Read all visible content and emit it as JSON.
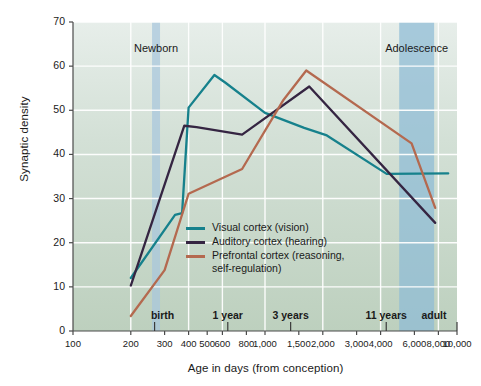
{
  "chart_data": {
    "type": "line",
    "title": "",
    "xlabel": "Age in days (from conception)",
    "ylabel": "Synaptic density",
    "xscale": "log",
    "xlim": [
      100,
      10000
    ],
    "ylim": [
      0,
      70
    ],
    "grid": true,
    "legend_position": "center",
    "y_ticks": [
      0,
      10,
      20,
      30,
      40,
      50,
      60,
      70
    ],
    "x_ticks": [
      100,
      200,
      300,
      400,
      500,
      600,
      800,
      1000,
      1500,
      2000,
      3000,
      4000,
      6000,
      8000,
      10000
    ],
    "x_tick_labels": [
      "100",
      "200",
      "300",
      "400",
      "500",
      "600",
      "800",
      "1,000",
      "1,500",
      "2,000",
      "3,000",
      "4,000",
      "6,000",
      "8,000",
      "10,000"
    ],
    "milestones": [
      {
        "label": "birth",
        "x": 266
      },
      {
        "label": "1 year",
        "x": 640
      },
      {
        "label": "3 years",
        "x": 1360
      },
      {
        "label": "11 years",
        "x": 4280
      },
      {
        "label": "adult",
        "x": 10000
      }
    ],
    "eras": [
      {
        "label": "Newborn",
        "x_start": 258,
        "x_end": 284,
        "color": "#a8c6dd"
      },
      {
        "label": "Adolescence",
        "x_start": 5000,
        "x_end": 7600,
        "color": "#8ebbd6"
      }
    ],
    "series": [
      {
        "name": "Visual cortex (vision)",
        "color": "#16818c",
        "points": [
          [
            200,
            12.0
          ],
          [
            340,
            26.3
          ],
          [
            370,
            26.7
          ],
          [
            400,
            50.6
          ],
          [
            545,
            58.0
          ],
          [
            620,
            56.3
          ],
          [
            1000,
            49.4
          ],
          [
            1600,
            46.0
          ],
          [
            2100,
            44.3
          ],
          [
            4300,
            35.6
          ],
          [
            9000,
            35.7
          ]
        ]
      },
      {
        "name": "Auditory cortex (hearing)",
        "color": "#352542",
        "points": [
          [
            200,
            10.3
          ],
          [
            380,
            46.5
          ],
          [
            440,
            46.2
          ],
          [
            760,
            44.5
          ],
          [
            1700,
            55.4
          ],
          [
            7700,
            24.5
          ]
        ]
      },
      {
        "name": "Prefrontal cortex (reasoning,\nself-regulation)",
        "color": "#b4694f",
        "points": [
          [
            200,
            3.4
          ],
          [
            300,
            13.8
          ],
          [
            400,
            31.1
          ],
          [
            760,
            36.7
          ],
          [
            1250,
            52.4
          ],
          [
            1640,
            59.0
          ],
          [
            5800,
            42.5
          ],
          [
            7700,
            27.9
          ]
        ]
      }
    ]
  },
  "legend": {
    "items": [
      {
        "label": "Visual cortex (vision)",
        "color": "#16818c"
      },
      {
        "label": "Auditory cortex (hearing)",
        "color": "#352542"
      },
      {
        "label": "Prefrontal cortex (reasoning,\nself-regulation)",
        "color": "#b4694f"
      }
    ]
  }
}
